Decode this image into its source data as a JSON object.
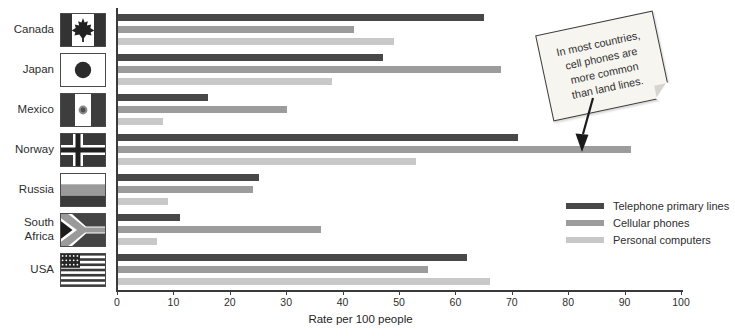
{
  "figure": {
    "width": 735,
    "height": 336,
    "background": "#ffffff"
  },
  "chart_data": {
    "type": "bar",
    "orientation": "horizontal",
    "title": "",
    "categories": [
      "Canada",
      "Japan",
      "Mexico",
      "Norway",
      "Russia",
      "South Africa",
      "USA"
    ],
    "series": [
      {
        "name": "Telephone primary lines",
        "color": "#484848",
        "values": [
          65,
          47,
          16,
          71,
          25,
          11,
          62
        ]
      },
      {
        "name": "Cellular phones",
        "color": "#9c9c9c",
        "values": [
          42,
          68,
          30,
          91,
          24,
          36,
          55
        ]
      },
      {
        "name": "Personal computers",
        "color": "#c8c8c8",
        "values": [
          49,
          38,
          8,
          53,
          9,
          7,
          66
        ]
      }
    ],
    "xlabel": "Rate per 100 people",
    "xlim": [
      0,
      100
    ],
    "xticks": [
      0,
      10,
      20,
      30,
      40,
      50,
      60,
      70,
      80,
      90,
      100
    ],
    "grid": false,
    "legend_position": "right-center",
    "flag_icons": [
      "canada-flag",
      "japan-flag",
      "mexico-flag",
      "norway-flag",
      "russia-flag",
      "south-africa-flag",
      "usa-flag"
    ]
  },
  "note": {
    "lines": [
      "In most countries,",
      "cell phones are",
      "more common",
      "than land lines."
    ]
  }
}
